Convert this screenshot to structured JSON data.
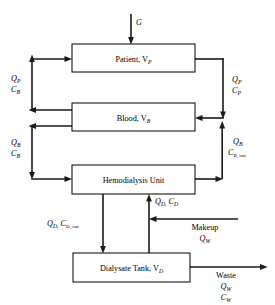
{
  "diagram": {
    "background_color": "#ffffff",
    "line_color": "#1a1a1a",
    "boxes": [
      {
        "id": "patient",
        "name": "Patient",
        "variable": "V",
        "variable_sub": "P",
        "label": "Patient, V"
      },
      {
        "id": "blood",
        "name": "Blood",
        "variable": "V",
        "variable_sub": "B",
        "label": "Blood, V"
      },
      {
        "id": "hemodialysis",
        "name": "Hemodialysis Unit",
        "variable": "",
        "variable_sub": "",
        "label": "Hemodialysis Unit"
      },
      {
        "id": "dialysate",
        "name": "Dialysate Tank",
        "variable": "V",
        "variable_sub": "D",
        "label": "Dialysate Tank, V"
      }
    ],
    "stream_labels": {
      "generation": {
        "symbol": "G",
        "sub": ""
      },
      "patient_return_flow": {
        "symbol": "Q",
        "sub": "P"
      },
      "patient_return_conc": {
        "symbol": "C",
        "sub": "B"
      },
      "patient_out_flow": {
        "symbol": "Q",
        "sub": "P"
      },
      "patient_out_conc": {
        "symbol": "C",
        "sub": "P"
      },
      "blood_return_flow": {
        "symbol": "Q",
        "sub": "B"
      },
      "blood_return_conc": {
        "symbol": "C",
        "sub": "B"
      },
      "blood_out_flow": {
        "symbol": "Q",
        "sub": "B"
      },
      "blood_out_conc": {
        "symbol": "C",
        "sub": "B, out"
      },
      "dialysate_out_flow": {
        "symbol": "Q",
        "sub": "D,"
      },
      "dialysate_out_conc": {
        "symbol": "C",
        "sub": "D, out"
      },
      "dialysate_in_flow": {
        "symbol": "Q",
        "sub": "D,"
      },
      "dialysate_in_conc": {
        "symbol": "C",
        "sub": "D"
      },
      "makeup": {
        "text": "Makeup",
        "symbol": "Q",
        "sub": "W"
      },
      "waste": {
        "text": "Waste",
        "symbol": "Q",
        "sub": "W",
        "symbol2": "C",
        "sub2": "W"
      }
    }
  }
}
